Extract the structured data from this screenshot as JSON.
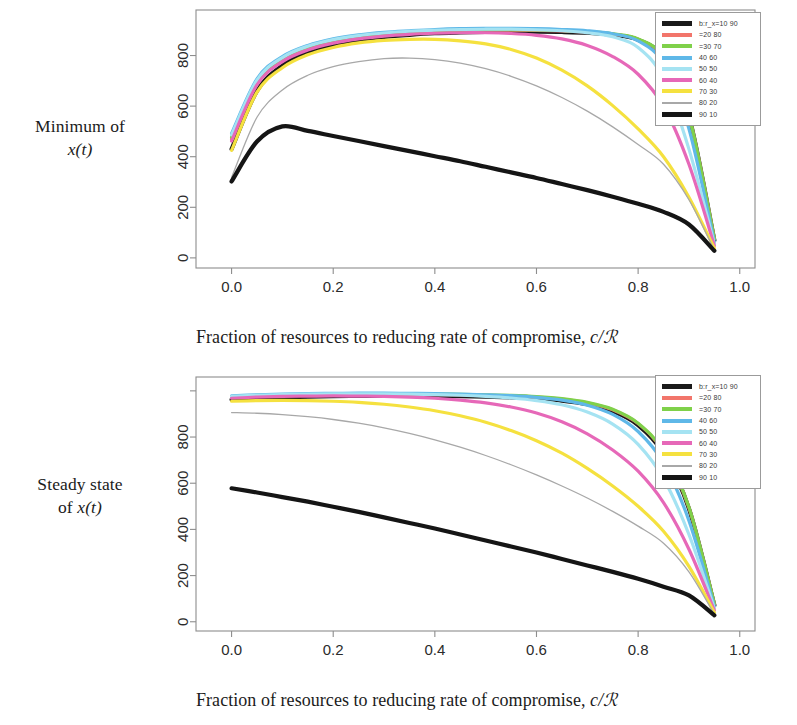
{
  "figure": {
    "panels": [
      {
        "id": "minimum-of-x",
        "ylabel_line1": "Minimum of",
        "ylabel_line2": "x(t)",
        "ylabel_math": "x(t)",
        "xlabel_prefix": "Fraction of resources to reducing rate of compromise, ",
        "xlabel_math": "c/ℛ"
      },
      {
        "id": "steady-state-of-x",
        "ylabel_line1": "Steady state",
        "ylabel_line2": "of x(t)",
        "ylabel_math": "x(t)",
        "xlabel_prefix": "Fraction of resources to reducing rate of compromise, ",
        "xlabel_math": "c/ℛ"
      }
    ]
  },
  "legend": {
    "entries": [
      {
        "label": "b:r_x=10 90",
        "color": "#1a1a1a",
        "weight": "thick"
      },
      {
        "label": "=20 80",
        "color": "#f2756b",
        "weight": "normal"
      },
      {
        "label": "=30 70",
        "color": "#7fd14a",
        "weight": "normal"
      },
      {
        "label": "40 60",
        "color": "#5fb8e8",
        "weight": "normal"
      },
      {
        "label": "50 50",
        "color": "#a5e3f2",
        "weight": "normal"
      },
      {
        "label": "60 40",
        "color": "#e668b8",
        "weight": "normal"
      },
      {
        "label": "70 30",
        "color": "#f5e13f",
        "weight": "normal"
      },
      {
        "label": "80 20",
        "color": "#a8a8a8",
        "weight": "thin"
      },
      {
        "label": "90 10",
        "color": "#151515",
        "weight": "thick"
      }
    ]
  },
  "chart_data": [
    {
      "type": "line",
      "id": "minimum-of-x-t",
      "title": "",
      "xlabel": "Fraction of resources to reducing rate of compromise, c/R",
      "ylabel": "Minimum of x(t)",
      "xlim": [
        -0.07,
        1.03
      ],
      "ylim": [
        -40,
        980
      ],
      "xticks": [
        0.0,
        0.2,
        0.4,
        0.6,
        0.8,
        1.0
      ],
      "xticklabels": [
        "0.0",
        "0.2",
        "0.4",
        "0.6",
        "0.8",
        "1.0"
      ],
      "yticks": [
        0,
        200,
        400,
        600,
        800
      ],
      "yticklabels": [
        "0",
        "200",
        "400",
        "600",
        "800"
      ],
      "grid": false,
      "legend_position": "top-right",
      "x": [
        0.0,
        0.05,
        0.1,
        0.15,
        0.2,
        0.25,
        0.3,
        0.35,
        0.4,
        0.45,
        0.5,
        0.55,
        0.6,
        0.65,
        0.7,
        0.75,
        0.8,
        0.85,
        0.9,
        0.95
      ],
      "series": [
        {
          "name": "b:r_x=10 90",
          "color": "#1a1a1a",
          "weight": "thick",
          "values": [
            430,
            660,
            760,
            812,
            842,
            862,
            874,
            882,
            888,
            891,
            893,
            894,
            894,
            893,
            890,
            882,
            862,
            790,
            560,
            70
          ]
        },
        {
          "name": "=20 80",
          "color": "#f2756b",
          "weight": "normal",
          "values": [
            470,
            690,
            782,
            828,
            855,
            872,
            883,
            890,
            895,
            898,
            900,
            900,
            899,
            897,
            893,
            884,
            864,
            792,
            562,
            75
          ]
        },
        {
          "name": "=30 70",
          "color": "#7fd14a",
          "weight": "normal",
          "values": [
            478,
            696,
            787,
            832,
            859,
            876,
            886,
            893,
            897,
            900,
            902,
            902,
            901,
            899,
            895,
            886,
            866,
            794,
            563,
            76
          ]
        },
        {
          "name": "40 60",
          "color": "#5fb8e8",
          "weight": "normal",
          "values": [
            492,
            708,
            796,
            840,
            866,
            882,
            892,
            898,
            903,
            906,
            907,
            907,
            906,
            903,
            898,
            886,
            858,
            768,
            510,
            62
          ]
        },
        {
          "name": "50 50",
          "color": "#a5e3f2",
          "weight": "normal",
          "values": [
            486,
            703,
            792,
            837,
            863,
            879,
            889,
            896,
            900,
            903,
            904,
            904,
            902,
            898,
            890,
            874,
            832,
            710,
            430,
            55
          ]
        },
        {
          "name": "60 40",
          "color": "#e668b8",
          "weight": "normal",
          "values": [
            462,
            684,
            776,
            822,
            849,
            866,
            877,
            884,
            888,
            890,
            890,
            887,
            880,
            866,
            840,
            796,
            726,
            600,
            370,
            48
          ]
        },
        {
          "name": "70 30",
          "color": "#f5e13f",
          "weight": "normal",
          "values": [
            425,
            655,
            752,
            803,
            832,
            850,
            860,
            864,
            864,
            858,
            846,
            824,
            790,
            742,
            680,
            602,
            510,
            400,
            240,
            38
          ]
        },
        {
          "name": "80 20",
          "color": "#a8a8a8",
          "weight": "thin",
          "values": [
            318,
            556,
            664,
            722,
            756,
            776,
            788,
            790,
            784,
            770,
            748,
            718,
            680,
            634,
            580,
            518,
            448,
            370,
            230,
            30
          ]
        },
        {
          "name": "90 10",
          "color": "#151515",
          "weight": "thick",
          "values": [
            302,
            460,
            520,
            502,
            482,
            462,
            442,
            422,
            402,
            382,
            360,
            338,
            316,
            292,
            268,
            242,
            214,
            182,
            132,
            28
          ]
        }
      ]
    },
    {
      "type": "line",
      "id": "steady-state-of-x-t",
      "title": "",
      "xlabel": "Fraction of resources to reducing rate of compromise, c/R",
      "ylabel": "Steady state of x(t)",
      "xlim": [
        -0.07,
        1.03
      ],
      "ylim": [
        -40,
        1060
      ],
      "xticks": [
        0.0,
        0.2,
        0.4,
        0.6,
        0.8,
        1.0
      ],
      "xticklabels": [
        "0.0",
        "0.2",
        "0.4",
        "0.6",
        "0.8",
        "1.0"
      ],
      "yticks": [
        0,
        200,
        400,
        600,
        800,
        1000
      ],
      "yticklabels": [
        "0",
        "200",
        "400",
        "600",
        "800",
        ""
      ],
      "grid": false,
      "legend_position": "top-right",
      "x": [
        0.0,
        0.05,
        0.1,
        0.15,
        0.2,
        0.25,
        0.3,
        0.35,
        0.4,
        0.45,
        0.5,
        0.55,
        0.6,
        0.65,
        0.7,
        0.75,
        0.8,
        0.85,
        0.9,
        0.95
      ],
      "series": [
        {
          "name": "b:r_x=10 90",
          "color": "#1a1a1a",
          "weight": "thick",
          "values": [
            962,
            968,
            972,
            975,
            977,
            978,
            979,
            979,
            978,
            977,
            975,
            972,
            967,
            958,
            942,
            912,
            852,
            730,
            490,
            72
          ]
        },
        {
          "name": "=20 80",
          "color": "#f2756b",
          "weight": "normal",
          "values": [
            972,
            977,
            980,
            982,
            984,
            985,
            985,
            985,
            984,
            983,
            981,
            978,
            973,
            964,
            948,
            918,
            858,
            736,
            494,
            76
          ]
        },
        {
          "name": "=30 70",
          "color": "#7fd14a",
          "weight": "normal",
          "values": [
            975,
            980,
            983,
            985,
            986,
            987,
            987,
            987,
            986,
            985,
            983,
            980,
            975,
            966,
            950,
            920,
            860,
            738,
            496,
            78
          ]
        },
        {
          "name": "40 60",
          "color": "#5fb8e8",
          "weight": "normal",
          "values": [
            978,
            983,
            986,
            988,
            989,
            990,
            990,
            989,
            988,
            986,
            983,
            979,
            972,
            960,
            938,
            898,
            824,
            688,
            438,
            66
          ]
        },
        {
          "name": "50 50",
          "color": "#a5e3f2",
          "weight": "normal",
          "values": [
            976,
            981,
            984,
            986,
            987,
            987,
            987,
            986,
            984,
            981,
            976,
            969,
            958,
            940,
            908,
            856,
            768,
            620,
            378,
            58
          ]
        },
        {
          "name": "60 40",
          "color": "#e668b8",
          "weight": "normal",
          "values": [
            968,
            973,
            976,
            977,
            978,
            977,
            976,
            973,
            968,
            960,
            948,
            930,
            904,
            866,
            814,
            744,
            652,
            516,
            314,
            50
          ]
        },
        {
          "name": "70 30",
          "color": "#f5e13f",
          "weight": "normal",
          "values": [
            955,
            958,
            959,
            958,
            955,
            950,
            942,
            930,
            914,
            892,
            864,
            828,
            784,
            730,
            664,
            588,
            500,
            392,
            240,
            40
          ]
        },
        {
          "name": "80 20",
          "color": "#a8a8a8",
          "weight": "thin",
          "values": [
            906,
            903,
            897,
            888,
            876,
            860,
            840,
            816,
            788,
            756,
            720,
            680,
            636,
            588,
            536,
            478,
            414,
            340,
            216,
            32
          ]
        },
        {
          "name": "90 10",
          "color": "#151515",
          "weight": "thick",
          "values": [
            578,
            560,
            540,
            520,
            498,
            476,
            452,
            428,
            404,
            378,
            352,
            326,
            300,
            272,
            244,
            216,
            186,
            152,
            114,
            28
          ]
        }
      ]
    }
  ]
}
